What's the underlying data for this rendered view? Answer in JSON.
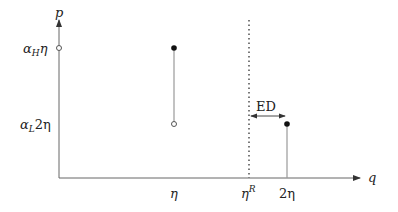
{
  "diagram": {
    "axes": {
      "y_label": "p",
      "x_label": "q"
    },
    "y_ticks": [
      {
        "label_main": "α",
        "label_sub": "H",
        "label_rest": "η",
        "y": 48
      },
      {
        "label_main": "α",
        "label_sub": "L",
        "label_rest": "2η",
        "y": 124
      }
    ],
    "x_ticks": [
      {
        "label": "η",
        "x": 174
      },
      {
        "label_main": "η",
        "label_sup": "R",
        "x": 249
      },
      {
        "label": "2η",
        "x": 287
      }
    ],
    "annotation": {
      "label": "ED"
    },
    "colors": {
      "axis": "#555555",
      "segment": "#888888",
      "dot": "#111111"
    }
  }
}
